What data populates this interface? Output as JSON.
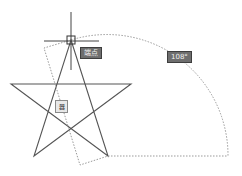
{
  "canvas": {
    "background": "#ffffff",
    "line_color": "#555555",
    "dotted_color": "#9a9a9a"
  },
  "star": {
    "vertices": [
      [
        71,
        40
      ],
      [
        108,
        156
      ],
      [
        11,
        84
      ],
      [
        131,
        84
      ],
      [
        34,
        156
      ]
    ]
  },
  "rotation_preview": {
    "polyline": [
      [
        71,
        40
      ],
      [
        44,
        48
      ],
      [
        80,
        165
      ],
      [
        108,
        156
      ],
      [
        228,
        156
      ]
    ],
    "arc": {
      "cx": 108,
      "cy": 156,
      "r": 121,
      "start": [
        71,
        40
      ],
      "end": [
        228,
        156
      ]
    }
  },
  "crosshair": {
    "x": 71,
    "y": 40
  },
  "tooltips": {
    "snap_label": "端点",
    "angle_label": "108°",
    "input_value": "器"
  }
}
